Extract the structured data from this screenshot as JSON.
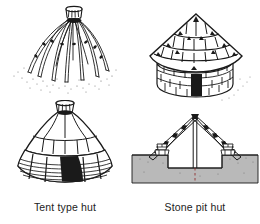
{
  "figure": {
    "background_color": "#ffffff",
    "ink_color": "#1a1a1a",
    "ground_fill_color": "#b9b9b9",
    "panels": [
      {
        "id": "frame",
        "name": "pole-frame-diagram",
        "description": "Conical framework of bent poles lashed at a crown ring at the apex, splaying outward to the stippled ground"
      },
      {
        "id": "stone",
        "name": "stone-thatch-hut-diagram",
        "description": "Round hut with conical thatched roof in banded courses over a dry stone masonry wall with a dark doorway"
      },
      {
        "id": "tent",
        "name": "tent-hut-diagram",
        "description": "Conical tent hut covered with hide panels above and horizontally hatched woven matting below, with a solid black doorway"
      },
      {
        "id": "pit",
        "name": "pit-hut-section-diagram",
        "description": "Cross section of an A-frame roof on stone footings over an excavated sunken pit floor with a central ridge post"
      }
    ],
    "captions": {
      "tent": "Tent type hut",
      "pit": "Stone pit hut"
    }
  }
}
